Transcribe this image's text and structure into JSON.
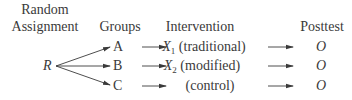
{
  "headers": {
    "random_line1": "Random",
    "random_line2": "Assignment",
    "groups": "Groups",
    "intervention": "Intervention",
    "posttest": "Posttest"
  },
  "source_node": "R",
  "rows": [
    {
      "group": "A",
      "intervention_symbol": "X",
      "intervention_sub": "1",
      "intervention_label": "(traditional)",
      "posttest": "O"
    },
    {
      "group": "B",
      "intervention_symbol": "X",
      "intervention_sub": "2",
      "intervention_label": "(modified)",
      "posttest": "O"
    },
    {
      "group": "C",
      "intervention_symbol": "",
      "intervention_sub": "",
      "intervention_label": "(control)",
      "posttest": "O"
    }
  ],
  "colors": {
    "text": "#3a3a3a",
    "arrow": "#3a3a3a",
    "background": "#ffffff"
  }
}
